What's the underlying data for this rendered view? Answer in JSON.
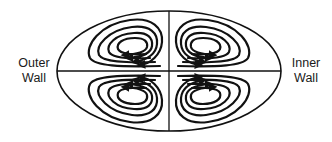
{
  "labels": {
    "outer_wall": [
      "Outer",
      "Wall"
    ],
    "inner_wall": [
      "Inner",
      "Wall"
    ]
  },
  "diagram": {
    "type": "secondary-flow cross-section",
    "shape": "ellipse",
    "quadrants": [
      {
        "position": "upper-left",
        "loops": 4,
        "arrow_direction": "left (along bottom)"
      },
      {
        "position": "upper-right",
        "loops": 4,
        "arrow_direction": "right (along bottom)"
      },
      {
        "position": "lower-left",
        "loops": 4,
        "arrow_direction": "left (along top)"
      },
      {
        "position": "lower-right",
        "loops": 4,
        "arrow_direction": "right (along top)"
      }
    ],
    "stroke_color": "#111111",
    "background": "#ffffff"
  }
}
